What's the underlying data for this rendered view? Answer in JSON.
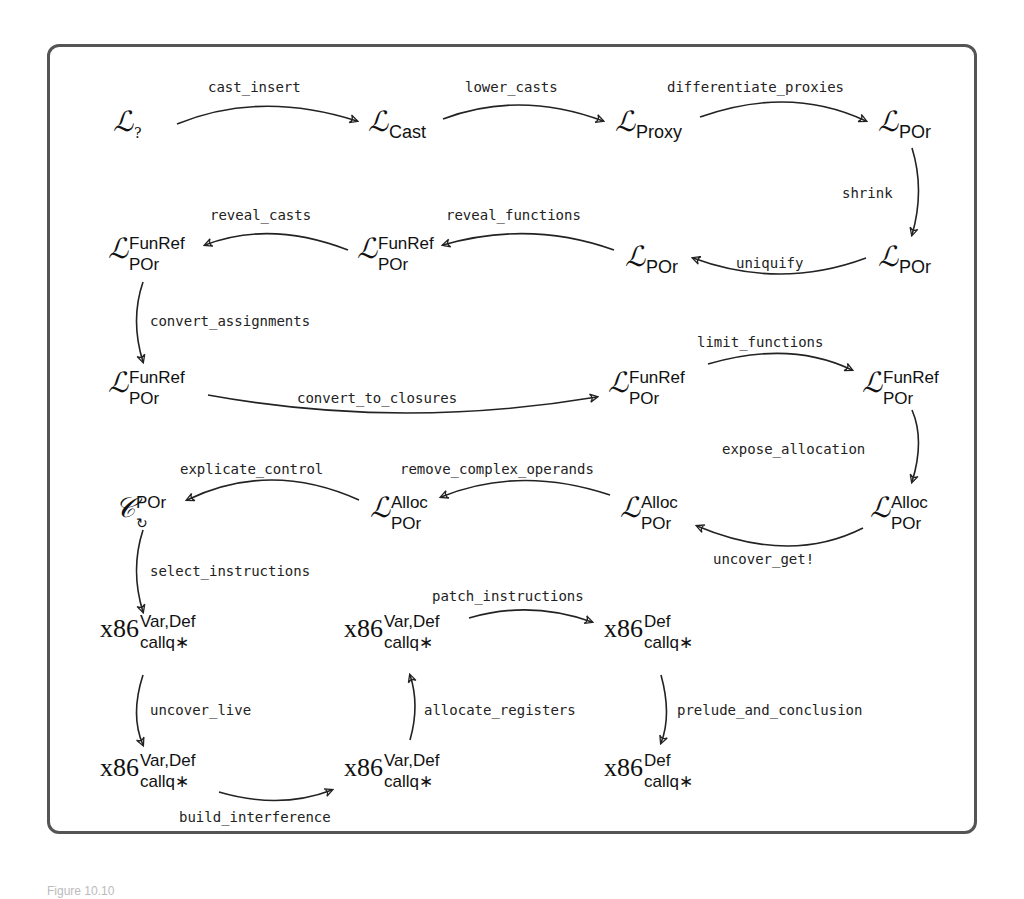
{
  "figure": {
    "caption": "Figure 10.10",
    "border_color": "#555555"
  },
  "nodes": {
    "L_q": {
      "base": "ℒ",
      "sup": "",
      "sub": "?"
    },
    "L_cast": {
      "base": "ℒ",
      "sup": "",
      "sub": "Cast"
    },
    "L_proxy": {
      "base": "ℒ",
      "sup": "",
      "sub": "Proxy"
    },
    "L_por1": {
      "base": "ℒ",
      "sup": "",
      "sub": "POr"
    },
    "L_por2": {
      "base": "ℒ",
      "sup": "",
      "sub": "POr"
    },
    "L_por3": {
      "base": "ℒ",
      "sup": "",
      "sub": "POr"
    },
    "L_fr1": {
      "base": "ℒ",
      "sup": "FunRef",
      "sub": "POr"
    },
    "L_fr2": {
      "base": "ℒ",
      "sup": "FunRef",
      "sub": "POr"
    },
    "L_fr3": {
      "base": "ℒ",
      "sup": "FunRef",
      "sub": "POr"
    },
    "L_fr4": {
      "base": "ℒ",
      "sup": "FunRef",
      "sub": "POr"
    },
    "L_fr5": {
      "base": "ℒ",
      "sup": "FunRef",
      "sub": "POr"
    },
    "L_alloc1": {
      "base": "ℒ",
      "sup": "Alloc",
      "sub": "POr"
    },
    "L_alloc2": {
      "base": "ℒ",
      "sup": "Alloc",
      "sub": "POr"
    },
    "L_alloc3": {
      "base": "ℒ",
      "sup": "Alloc",
      "sub": "POr"
    },
    "C_loop": {
      "base": "𝒞",
      "sup": "POr",
      "sub": "↻"
    },
    "x86_1": {
      "base": "x86",
      "sup": "Var,Def",
      "sub": "callq∗"
    },
    "x86_2": {
      "base": "x86",
      "sup": "Var,Def",
      "sub": "callq∗"
    },
    "x86_3": {
      "base": "x86",
      "sup": "Def",
      "sub": "callq∗"
    },
    "x86_4": {
      "base": "x86",
      "sup": "Var,Def",
      "sub": "callq∗"
    },
    "x86_5": {
      "base": "x86",
      "sup": "Var,Def",
      "sub": "callq∗"
    },
    "x86_6": {
      "base": "x86",
      "sup": "Def",
      "sub": "callq∗"
    }
  },
  "passes": {
    "cast_insert": "cast_insert",
    "lower_casts": "lower_casts",
    "differentiate_proxies": "differentiate_proxies",
    "shrink": "shrink",
    "uniquify": "uniquify",
    "reveal_functions": "reveal_functions",
    "reveal_casts": "reveal_casts",
    "convert_assignments": "convert_assignments",
    "convert_to_closures": "convert_to_closures",
    "limit_functions": "limit_functions",
    "expose_allocation": "expose_allocation",
    "uncover_get": "uncover_get!",
    "remove_complex_operands": "remove_complex_operands",
    "explicate_control": "explicate_control",
    "select_instructions": "select_instructions",
    "uncover_live": "uncover_live",
    "build_interference": "build_interference",
    "allocate_registers": "allocate_registers",
    "patch_instructions": "patch_instructions",
    "prelude_and_conclusion": "prelude_and_conclusion"
  }
}
